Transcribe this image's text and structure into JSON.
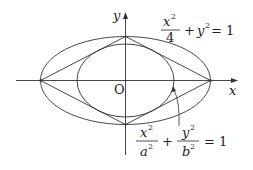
{
  "axes": {
    "x_label": "x",
    "y_label": "y",
    "origin_label": "O"
  },
  "outer_ellipse": {
    "lhs_num": "x",
    "lhs_exp": "2",
    "lhs_den": "4",
    "plus": "+",
    "y_term": "y",
    "y_exp": "2",
    "eq": "= 1"
  },
  "inner_ellipse": {
    "t1_num": "x",
    "t1_num_exp": "2",
    "t1_den": "a",
    "t1_den_exp": "2",
    "plus": "+",
    "t2_num": "y",
    "t2_num_exp": "2",
    "t2_den": "b",
    "t2_den_exp": "2",
    "eq": "= 1"
  },
  "colors": {
    "stroke": "#333333",
    "text": "#222222"
  }
}
